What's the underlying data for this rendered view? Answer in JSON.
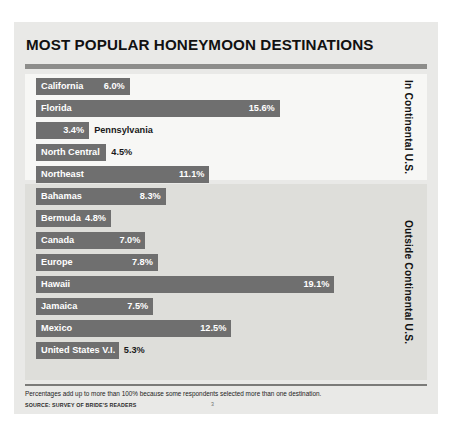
{
  "title": "MOST POPULAR HONEYMOON DESTINATIONS",
  "groups": {
    "top_label": "In Continental U.S.",
    "bottom_label": "Outside Continental U.S."
  },
  "footnote": "Percentages add up to more than 100% because some respondents selected more than one destination.",
  "source": "SOURCE: SURVEY OF BRIDE'S READERS",
  "page_number": "3",
  "colors": {
    "bar": "#6f6f6f",
    "card_background": "#e9e9e7",
    "group_top_background": "#f7f7f5",
    "group_bottom_background": "#dededa",
    "rule": "#8d8d8b",
    "value_inside": "#ffffff",
    "value_outside": "#1a1a1a"
  },
  "chart_data": {
    "type": "bar",
    "orientation": "horizontal",
    "title": "MOST POPULAR HONEYMOON DESTINATIONS",
    "xlabel": "",
    "ylabel": "",
    "xlim": [
      0,
      22.4
    ],
    "grid": false,
    "legend": "none",
    "value_format": "percent",
    "categories": [
      "California",
      "Florida",
      "Pennsylvania",
      "North Central",
      "Northeast",
      "Southeast",
      "Mountain West",
      "Bahamas",
      "Bermuda",
      "Canada",
      "Europe",
      "Hawaii",
      "Jamaica",
      "Mexico",
      "United States V.I."
    ],
    "values": [
      6.0,
      15.6,
      3.4,
      4.5,
      11.1,
      22.4,
      12.3,
      8.3,
      4.8,
      7.0,
      7.8,
      19.1,
      7.5,
      12.5,
      5.3
    ],
    "groups": [
      {
        "name": "In Continental U.S.",
        "categories": [
          "California",
          "Florida",
          "Pennsylvania",
          "North Central",
          "Northeast",
          "Southeast",
          "Mountain West"
        ],
        "values": [
          6.0,
          15.6,
          3.4,
          4.5,
          11.1,
          22.4,
          12.3
        ]
      },
      {
        "name": "Outside Continental U.S.",
        "categories": [
          "Bahamas",
          "Bermuda",
          "Canada",
          "Europe",
          "Hawaii",
          "Jamaica",
          "Mexico",
          "United States V.I."
        ],
        "values": [
          8.3,
          4.8,
          7.0,
          7.8,
          19.1,
          7.5,
          12.5,
          5.3
        ]
      }
    ]
  },
  "bars_top": [
    {
      "label": "California",
      "value": "6.0%",
      "label_inside": true,
      "value_inside": true
    },
    {
      "label": "Florida",
      "value": "15.6%",
      "label_inside": true,
      "value_inside": true
    },
    {
      "label": "Pennsylvania",
      "value": "3.4%",
      "label_inside": false,
      "value_inside": true
    },
    {
      "label": "North Central",
      "value": "4.5%",
      "label_inside": true,
      "value_inside": false
    },
    {
      "label": "Northeast",
      "value": "11.1%",
      "label_inside": true,
      "value_inside": true
    },
    {
      "label": "Southeast",
      "value": "22.4%",
      "label_inside": true,
      "value_inside": true
    },
    {
      "label": "Mountain West",
      "value": "12.3%",
      "label_inside": true,
      "value_inside": true
    }
  ],
  "bars_bottom": [
    {
      "label": "Bahamas",
      "value": "8.3%",
      "label_inside": true,
      "value_inside": true
    },
    {
      "label": "Bermuda",
      "value": "4.8%",
      "label_inside": true,
      "value_inside": true
    },
    {
      "label": "Canada",
      "value": "7.0%",
      "label_inside": true,
      "value_inside": true
    },
    {
      "label": "Europe",
      "value": "7.8%",
      "label_inside": true,
      "value_inside": true
    },
    {
      "label": "Hawaii",
      "value": "19.1%",
      "label_inside": true,
      "value_inside": true
    },
    {
      "label": "Jamaica",
      "value": "7.5%",
      "label_inside": true,
      "value_inside": true
    },
    {
      "label": "Mexico",
      "value": "12.5%",
      "label_inside": true,
      "value_inside": true
    },
    {
      "label": "United States V.I.",
      "value": "5.3%",
      "label_inside": true,
      "value_inside": false
    }
  ]
}
